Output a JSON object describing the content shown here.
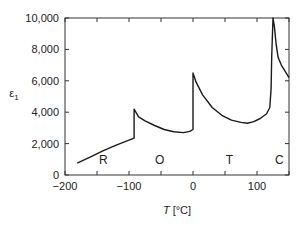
{
  "chart_data": {
    "type": "line",
    "title": "",
    "xlabel": "T [°C]",
    "xlabel_var": "T",
    "xlabel_unit": " [°C]",
    "ylabel": "ε₁",
    "ylabel_var": "ε",
    "ylabel_sub": "1",
    "xlim": [
      -200,
      150
    ],
    "ylim": [
      0,
      10000
    ],
    "grid": false,
    "legend": null,
    "x_ticks": [
      -200,
      -150,
      -100,
      -50,
      0,
      50,
      100,
      150
    ],
    "x_tick_labels": [
      {
        "value": -200,
        "label": "−200"
      },
      {
        "value": -100,
        "label": "−100"
      },
      {
        "value": 0,
        "label": "0"
      },
      {
        "value": 100,
        "label": "100"
      }
    ],
    "y_ticks": [
      0,
      2000,
      4000,
      6000,
      8000,
      10000
    ],
    "y_tick_labels": [
      {
        "value": 0,
        "label": "0"
      },
      {
        "value": 2000,
        "label": "2,000"
      },
      {
        "value": 4000,
        "label": "4,000"
      },
      {
        "value": 6000,
        "label": "6,000"
      },
      {
        "value": 8000,
        "label": "8,000"
      },
      {
        "value": 10000,
        "label": "10,000"
      }
    ],
    "annotations": [
      {
        "text": "R",
        "x": -140,
        "y": 700
      },
      {
        "text": "O",
        "x": -52,
        "y": 700
      },
      {
        "text": "T",
        "x": 57,
        "y": 700
      },
      {
        "text": "C",
        "x": 135,
        "y": 700
      }
    ],
    "series": [
      {
        "name": "ε₁ vs T",
        "color": "#1a1a1a",
        "points": [
          [
            -181,
            760
          ],
          [
            -160,
            1150
          ],
          [
            -140,
            1550
          ],
          [
            -120,
            1900
          ],
          [
            -92,
            2350
          ],
          [
            -92,
            4200
          ],
          [
            -85,
            3700
          ],
          [
            -75,
            3450
          ],
          [
            -60,
            3150
          ],
          [
            -45,
            2900
          ],
          [
            -30,
            2750
          ],
          [
            -15,
            2700
          ],
          [
            -5,
            2780
          ],
          [
            0,
            2900
          ],
          [
            0,
            6500
          ],
          [
            5,
            5900
          ],
          [
            15,
            5100
          ],
          [
            30,
            4300
          ],
          [
            45,
            3800
          ],
          [
            60,
            3500
          ],
          [
            75,
            3350
          ],
          [
            85,
            3300
          ],
          [
            95,
            3400
          ],
          [
            105,
            3600
          ],
          [
            115,
            3900
          ],
          [
            120,
            4300
          ],
          [
            122,
            5500
          ],
          [
            123,
            7500
          ],
          [
            125,
            10000
          ],
          [
            127,
            9500
          ],
          [
            130,
            8300
          ],
          [
            133,
            7500
          ],
          [
            138,
            7000
          ],
          [
            144,
            6600
          ],
          [
            150,
            6200
          ]
        ]
      }
    ]
  }
}
